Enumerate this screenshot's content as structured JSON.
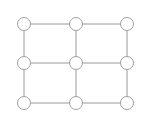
{
  "diagram": {
    "type": "grid-graph",
    "rows": 3,
    "cols": 3,
    "colors": {
      "edge": "#9a9a9a",
      "node_stroke": "#a0a0a0",
      "node_fill": "#ffffff",
      "background": "#ffffff"
    },
    "node_radius": 6.5,
    "nodes": [
      {
        "id": "n00",
        "x": 24,
        "y": 24
      },
      {
        "id": "n01",
        "x": 76,
        "y": 24
      },
      {
        "id": "n02",
        "x": 127,
        "y": 24
      },
      {
        "id": "n10",
        "x": 24,
        "y": 63
      },
      {
        "id": "n11",
        "x": 76,
        "y": 63
      },
      {
        "id": "n12",
        "x": 127,
        "y": 63
      },
      {
        "id": "n20",
        "x": 24,
        "y": 103
      },
      {
        "id": "n21",
        "x": 76,
        "y": 103
      },
      {
        "id": "n22",
        "x": 127,
        "y": 103
      }
    ],
    "edges": [
      [
        "n00",
        "n01"
      ],
      [
        "n01",
        "n02"
      ],
      [
        "n10",
        "n11"
      ],
      [
        "n11",
        "n12"
      ],
      [
        "n20",
        "n21"
      ],
      [
        "n21",
        "n22"
      ],
      [
        "n00",
        "n10"
      ],
      [
        "n10",
        "n20"
      ],
      [
        "n01",
        "n11"
      ],
      [
        "n11",
        "n21"
      ],
      [
        "n02",
        "n12"
      ],
      [
        "n12",
        "n22"
      ]
    ]
  }
}
